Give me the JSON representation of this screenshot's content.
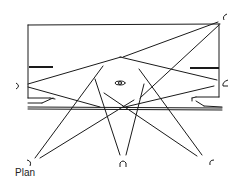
{
  "caption": "Plan",
  "colors": {
    "ink": "#1a1a1a",
    "background": "#ffffff"
  },
  "diagram": {
    "type": "architectural-plan-sight-lines",
    "room": {
      "x1": 28,
      "y1": 25,
      "x2": 220,
      "y2": 98
    },
    "viewer_positions": [
      {
        "id": "top-right",
        "x": 224,
        "y": 17,
        "glyph": "C"
      },
      {
        "id": "left",
        "x": 19,
        "y": 86,
        "glyph": "U"
      },
      {
        "id": "right",
        "x": 225,
        "y": 83,
        "glyph": "C"
      },
      {
        "id": "bottom-left",
        "x": 29,
        "y": 164,
        "glyph": "?"
      },
      {
        "id": "bottom-center",
        "x": 123,
        "y": 165,
        "glyph": "∩"
      },
      {
        "id": "bottom-right",
        "x": 212,
        "y": 162,
        "glyph": "C"
      }
    ],
    "center_object": {
      "x": 120,
      "y": 83,
      "label": "object"
    }
  }
}
